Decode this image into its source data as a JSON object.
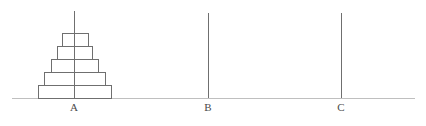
{
  "figure": {
    "type": "tower-of-hanoi",
    "width": 426,
    "height": 126,
    "background_color": "#ffffff",
    "line_color": "#6f6f6f",
    "baseline_color": "#bfbfbf",
    "label_color": "#4a4a4a",
    "disk_fill": "#ffffff"
  },
  "baseline": {
    "name": "ground-line",
    "x1": 12,
    "x2": 415,
    "y": 98,
    "stroke_width": 1
  },
  "pegs": [
    {
      "id": "A",
      "label": "A",
      "x": 74,
      "top_y": 11,
      "bottom_y": 98,
      "label_y": 101,
      "disk_count": 5
    },
    {
      "id": "B",
      "label": "B",
      "x": 208,
      "top_y": 13,
      "bottom_y": 98,
      "label_y": 101,
      "disk_count": 0
    },
    {
      "id": "C",
      "label": "C",
      "x": 341,
      "top_y": 13,
      "bottom_y": 98,
      "label_y": 101,
      "disk_count": 0
    }
  ],
  "disks": [
    {
      "id": "disk-5",
      "size": 5,
      "peg": "A",
      "level": 1,
      "x": 38,
      "y": 85,
      "width": 73,
      "height": 13
    },
    {
      "id": "disk-4",
      "size": 4,
      "peg": "A",
      "level": 2,
      "x": 44,
      "y": 72,
      "width": 61,
      "height": 13
    },
    {
      "id": "disk-3",
      "size": 3,
      "peg": "A",
      "level": 3,
      "x": 51,
      "y": 59,
      "width": 47,
      "height": 13
    },
    {
      "id": "disk-2",
      "size": 2,
      "peg": "A",
      "level": 4,
      "x": 57,
      "y": 46,
      "width": 35,
      "height": 13
    },
    {
      "id": "disk-1",
      "size": 1,
      "peg": "A",
      "level": 5,
      "x": 62,
      "y": 33,
      "width": 26,
      "height": 13
    }
  ]
}
